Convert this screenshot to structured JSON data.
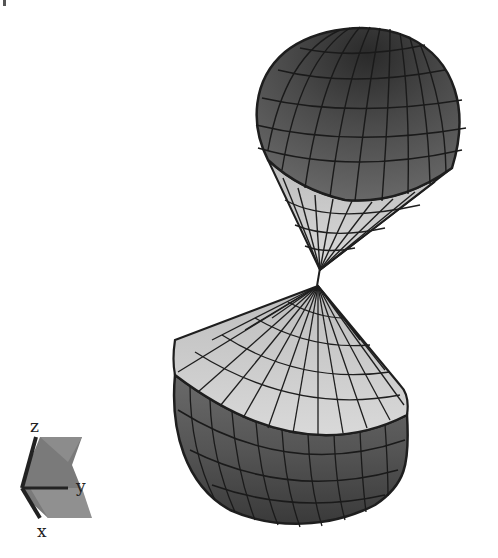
{
  "figure": {
    "upper_shape": {
      "name": "upper spherical cone",
      "cap_color": "#5a5a5a",
      "cone_color": "#c8c8c8"
    },
    "lower_shape": {
      "name": "lower spherical cone",
      "cap_color": "#5a5a5a",
      "cone_color": "#d2d2d2"
    },
    "grid_line_color": "#1e1e1e"
  },
  "axes_triad": {
    "labels": {
      "z": "z",
      "y": "y",
      "x": "x"
    }
  }
}
